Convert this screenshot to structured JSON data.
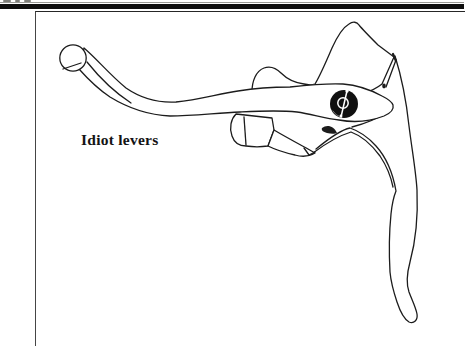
{
  "figure": {
    "caption": "Idiot levers",
    "type": "line-drawing",
    "colors": {
      "ink": "#1c1c1c",
      "paper": "#ffffff",
      "rule": "#0e0e0e",
      "emblem_fill": "#101010",
      "emblem_detail": "#ffffff"
    }
  }
}
